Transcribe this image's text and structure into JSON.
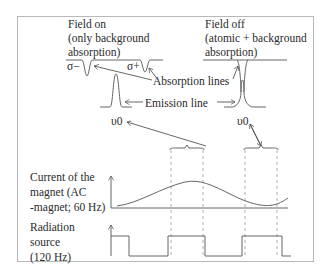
{
  "diagram": {
    "field_on": {
      "title_lines": [
        "Field on",
        "(only background",
        "absorption)"
      ],
      "sigma_minus": "σ−",
      "sigma_plus": "σ+",
      "nu0": "υ0"
    },
    "field_off": {
      "title_lines": [
        "Field off",
        "(atomic + background",
        "absorption)"
      ],
      "nu0": "υ0"
    },
    "annotations": {
      "absorption_lines": "Absorption lines",
      "emission_line": "Emission line"
    },
    "magnet": {
      "label_lines": [
        "Current of the",
        "magnet (AC",
        "-magnet; 60 Hz)"
      ],
      "waveform": "sine"
    },
    "source": {
      "label_lines": [
        "Radiation",
        "source",
        "(120 Hz)"
      ],
      "waveform": "square"
    },
    "colors": {
      "text": "#2a2a2a",
      "line": "#555555",
      "dashed": "#999999",
      "frame": "#b8b8b8"
    }
  }
}
